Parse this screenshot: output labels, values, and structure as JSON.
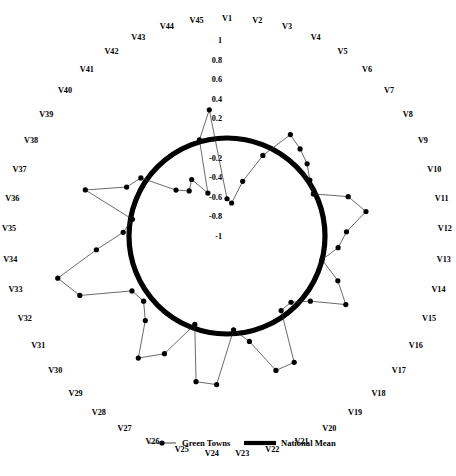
{
  "chart_data": {
    "type": "line",
    "subtype": "radar",
    "title": "",
    "xlabel": "",
    "ylabel": "",
    "rlim": [
      -1,
      1
    ],
    "grid": false,
    "legend_position": "bottom",
    "tick_labels": [
      "1",
      "0.8",
      "0.6",
      "0.4",
      "0.2",
      "-0.2",
      "-0.4",
      "-0.6",
      "-0.8",
      "-1"
    ],
    "tick_values": [
      1,
      0.8,
      0.6,
      0.4,
      0.2,
      -0.2,
      -0.4,
      -0.6,
      -0.8,
      -1
    ],
    "categories": [
      "V1",
      "V2",
      "V3",
      "V4",
      "V5",
      "V6",
      "V7",
      "V8",
      "V9",
      "V10",
      "V11",
      "V12",
      "V13",
      "V14",
      "V15",
      "V16",
      "V17",
      "V18",
      "V19",
      "V20",
      "V21",
      "V22",
      "V23",
      "V24",
      "V25",
      "V26",
      "V27",
      "V28",
      "V29",
      "V30",
      "V31",
      "V32",
      "V33",
      "V34",
      "V35",
      "V36",
      "V37",
      "V38",
      "V39",
      "V40",
      "V41",
      "V42",
      "V43",
      "V44",
      "V45"
    ],
    "series": [
      {
        "name": "Green Towns",
        "style": "thin-line-with-markers",
        "color": "#2b2b2b",
        "values": [
          -0.62,
          -0.66,
          -0.42,
          -0.1,
          0.22,
          0.16,
          0.1,
          0.02,
          -0.02,
          0.3,
          0.44,
          0.22,
          0.14,
          0.0,
          0.22,
          0.4,
          0.08,
          -0.06,
          -0.06,
          0.46,
          0.46,
          0.1,
          -0.04,
          0.52,
          0.52,
          -0.04,
          0.36,
          0.54,
          0.2,
          0.08,
          0.12,
          0.62,
          0.78,
          0.34,
          0.06,
          -0.02,
          0.52,
          0.14,
          0.06,
          -0.3,
          -0.4,
          -0.32,
          -0.52,
          0.02,
          0.3
        ]
      },
      {
        "name": "National Mean",
        "style": "thick-circle",
        "color": "#000000",
        "constant_value": 0
      }
    ],
    "legend": [
      {
        "label": "Green Towns",
        "marker": "line-with-dot",
        "color": "#2b2b2b"
      },
      {
        "label": "National Mean",
        "marker": "thick-line",
        "color": "#000000"
      }
    ]
  },
  "legend": {
    "green_towns": "Green Towns",
    "national_mean": "National Mean"
  }
}
